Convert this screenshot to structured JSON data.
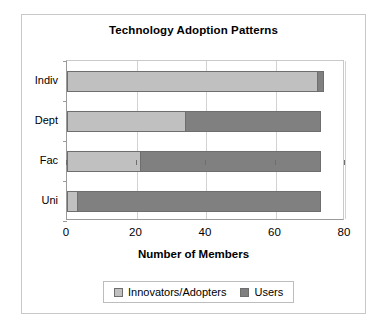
{
  "chart_data": {
    "type": "bar",
    "orientation": "horizontal",
    "stacked": true,
    "title": "Technology Adoption Patterns",
    "xlabel": "Number of Members",
    "ylabel": "",
    "xlim": [
      0,
      80
    ],
    "xticks": [
      0,
      20,
      40,
      60,
      80
    ],
    "grid": "vertical",
    "legend_position": "bottom",
    "categories": [
      "Indiv",
      "Dept",
      "Fac",
      "Uni"
    ],
    "series": [
      {
        "name": "Innovators/Adopters",
        "color": "#c0c0c0",
        "values": [
          72,
          34,
          21,
          3
        ]
      },
      {
        "name": "Users",
        "color": "#808080",
        "values": [
          2,
          39,
          52,
          70
        ]
      }
    ],
    "totals": [
      74,
      73,
      73,
      73
    ]
  }
}
